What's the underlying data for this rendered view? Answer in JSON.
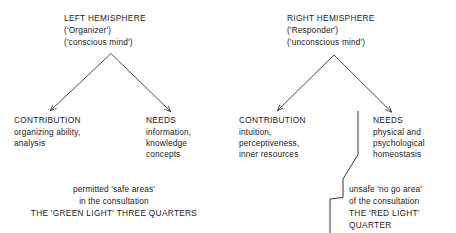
{
  "diagram": {
    "title_implicit": "Left and right hemisphere contributions and needs",
    "colors": {
      "ink": "#1a1a1a",
      "background": "#ffffff",
      "line": "#2b2b2b"
    },
    "hemispheres": [
      {
        "id": "left",
        "heading": "LEFT HEMISPHERE",
        "subtitle_1": "('Organizer')",
        "subtitle_2": "('conscious mind')",
        "branches": [
          {
            "id": "left-contribution",
            "heading": "CONTRIBUTION",
            "lines": [
              "organizing ability,",
              "analysis"
            ]
          },
          {
            "id": "left-needs",
            "heading": "NEEDS",
            "lines": [
              "information,",
              "knowledge",
              "concepts"
            ]
          }
        ]
      },
      {
        "id": "right",
        "heading": "RIGHT HEMISPHERE",
        "subtitle_1": "('Responder')",
        "subtitle_2": "('unconscious mind')",
        "branches": [
          {
            "id": "right-contribution",
            "heading": "CONTRIBUTION",
            "lines": [
              "intuition,",
              "perceptiveness,",
              "inner resources"
            ]
          },
          {
            "id": "right-needs",
            "heading": "NEEDS",
            "lines": [
              "physical and",
              "psychological",
              "homeostasis"
            ]
          }
        ]
      }
    ],
    "zones": [
      {
        "id": "green-light",
        "line_1": "permitted 'safe areas'",
        "line_2": "in the consultation",
        "line_3": "THE 'GREEN LIGHT' THREE QUARTERS"
      },
      {
        "id": "red-light",
        "line_1": "unsafe 'no go area'",
        "line_2": "of the consultation",
        "line_3": "THE 'RED LIGHT'",
        "line_4": "QUARTER"
      }
    ]
  }
}
